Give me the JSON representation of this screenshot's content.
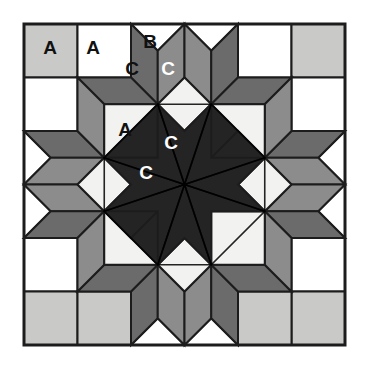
{
  "figure": {
    "name": "quilt-block-diagram",
    "width": 368,
    "height": 371,
    "background": "#ffffff"
  },
  "block": {
    "x": 24,
    "y": 24,
    "size": 321,
    "grid": 6,
    "cell": 53.5,
    "border_color": "#1c1c1c",
    "border_width": 3
  },
  "palette": {
    "white": "#ffffff",
    "offwhite": "#f2f2f0",
    "light_gray": "#c9c9c7",
    "medium_gray": "#8c8c8c",
    "dark_gray": "#6b6b6b",
    "darkest": "#242424",
    "outline": "#1c1c1c",
    "label_dark": "#111111",
    "label_light": "#ffffff"
  },
  "legend": {
    "a_meaning": "A",
    "b_meaning": "B",
    "c_meaning": "C"
  },
  "labels": [
    {
      "id": "label-a-1",
      "text": "A",
      "x": 50,
      "y": 47,
      "color": "#111111"
    },
    {
      "id": "label-a-2",
      "text": "A",
      "x": 93,
      "y": 47,
      "color": "#111111"
    },
    {
      "id": "label-b-1",
      "text": "B",
      "x": 150,
      "y": 41,
      "color": "#111111"
    },
    {
      "id": "label-c-1",
      "text": "C",
      "x": 132,
      "y": 68,
      "color": "#111111"
    },
    {
      "id": "label-c-2",
      "text": "C",
      "x": 168,
      "y": 68,
      "color": "#ffffff"
    },
    {
      "id": "label-a-3",
      "text": "A",
      "x": 125,
      "y": 129,
      "color": "#111111"
    },
    {
      "id": "label-c-3",
      "text": "C",
      "x": 171,
      "y": 142,
      "color": "#ffffff"
    },
    {
      "id": "label-c-4",
      "text": "C",
      "x": 146,
      "y": 172,
      "color": "#ffffff"
    }
  ],
  "patches": [
    {
      "name": "corner-square-top-left",
      "type": "square",
      "fill": "#c9c9c7",
      "points": "24,24 77.5,24 77.5,77.5 24,77.5"
    },
    {
      "name": "edge-square-top-1",
      "type": "square",
      "fill": "#ffffff",
      "points": "77.5,24 131,24 131,77.5 77.5,77.5"
    },
    {
      "name": "edge-square-top-2",
      "type": "square",
      "fill": "#ffffff",
      "points": "238,24 291.5,24 291.5,77.5 238,77.5"
    },
    {
      "name": "corner-square-top-right",
      "type": "square",
      "fill": "#c9c9c7",
      "points": "291.5,24 345,24 345,77.5 291.5,77.5"
    },
    {
      "name": "edge-square-left-1",
      "type": "square",
      "fill": "#ffffff",
      "points": "24,77.5 77.5,77.5 77.5,131 24,131"
    },
    {
      "name": "edge-square-right-1",
      "type": "square",
      "fill": "#ffffff",
      "points": "291.5,77.5 345,77.5 345,131 291.5,131"
    },
    {
      "name": "edge-square-left-2",
      "type": "square",
      "fill": "#ffffff",
      "points": "24,238 77.5,238 77.5,291.5 24,291.5"
    },
    {
      "name": "edge-square-right-2",
      "type": "square",
      "fill": "#ffffff",
      "points": "291.5,238 345,238 345,291.5 291.5,291.5"
    },
    {
      "name": "corner-square-bottom-left",
      "type": "square",
      "fill": "#c9c9c7",
      "points": "24,291.5 77.5,291.5 77.5,345 24,345"
    },
    {
      "name": "edge-square-bottom-1",
      "type": "square",
      "fill": "#ffffff",
      "points": "131,291.5 184.5,291.5 184.5,345 131,345"
    },
    {
      "name": "edge-square-bottom-2",
      "type": "square",
      "fill": "#ffffff",
      "points": "184.5,291.5 238,291.5 238,345 184.5,345"
    },
    {
      "name": "corner-square-bottom-right",
      "type": "square",
      "fill": "#c9c9c7",
      "points": "291.5,291.5 345,291.5 345,345 291.5,345"
    },
    {
      "name": "edge-square-bottom-left-lt",
      "type": "square",
      "fill": "#c9c9c7",
      "points": "77.5,291.5 131,291.5 131,345 77.5,345"
    },
    {
      "name": "edge-square-right-bottom-lt",
      "type": "square",
      "fill": "#c9c9c7",
      "points": "238,291.5 291.5,291.5 291.5,345 238,345"
    },
    {
      "name": "triangle-top-left-b",
      "type": "triangle",
      "fill": "#ffffff",
      "points": "131,24 184.5,24 157.75,50.75"
    },
    {
      "name": "triangle-top-right-b",
      "type": "triangle",
      "fill": "#ffffff",
      "points": "184.5,24 238,24 211.25,50.75"
    },
    {
      "name": "triangle-left-top-b",
      "type": "triangle",
      "fill": "#ffffff",
      "points": "24,131 24,184.5 50.75,157.75"
    },
    {
      "name": "triangle-left-bottom-b",
      "type": "triangle",
      "fill": "#ffffff",
      "points": "24,184.5 24,238 50.75,211.25"
    },
    {
      "name": "triangle-right-top-b",
      "type": "triangle",
      "fill": "#ffffff",
      "points": "345,131 345,184.5 318.25,157.75"
    },
    {
      "name": "triangle-right-bottom-b",
      "type": "triangle",
      "fill": "#ffffff",
      "points": "345,184.5 345,238 318.25,211.25"
    },
    {
      "name": "triangle-bottom-left-b",
      "type": "triangle",
      "fill": "#ffffff",
      "points": "131,345 184.5,345 157.75,318.25"
    },
    {
      "name": "triangle-bottom-right-b",
      "type": "triangle",
      "fill": "#ffffff",
      "points": "184.5,345 238,345 211.25,318.25"
    },
    {
      "name": "diamond-ring-tl-1",
      "type": "diamond",
      "fill": "#6b6b6b",
      "points": "131,24 157.75,50.75 157.75,104.25 131,77.5"
    },
    {
      "name": "diamond-ring-tl-2",
      "type": "diamond",
      "fill": "#8c8c8c",
      "points": "157.75,50.75 184.5,24 184.5,77.5 157.75,104.25"
    },
    {
      "name": "diamond-ring-tr-1",
      "type": "diamond",
      "fill": "#8c8c8c",
      "points": "184.5,24 211.25,50.75 211.25,104.25 184.5,77.5"
    },
    {
      "name": "diamond-ring-tr-2",
      "type": "diamond",
      "fill": "#6b6b6b",
      "points": "211.25,50.75 238,24 238,77.5 211.25,104.25"
    },
    {
      "name": "diamond-ring-lt-1",
      "type": "diamond",
      "fill": "#6b6b6b",
      "points": "24,131 50.75,157.75 104.25,157.75 77.5,131"
    },
    {
      "name": "diamond-ring-lt-2",
      "type": "diamond",
      "fill": "#8c8c8c",
      "points": "50.75,157.75 24,184.5 77.5,184.5 104.25,157.75"
    },
    {
      "name": "diamond-ring-lb-1",
      "type": "diamond",
      "fill": "#8c8c8c",
      "points": "24,184.5 50.75,211.25 104.25,211.25 77.5,184.5"
    },
    {
      "name": "diamond-ring-lb-2",
      "type": "diamond",
      "fill": "#6b6b6b",
      "points": "50.75,211.25 24,238 77.5,238 104.25,211.25"
    },
    {
      "name": "diamond-ring-rt-1",
      "type": "diamond",
      "fill": "#6b6b6b",
      "points": "345,131 318.25,157.75 264.75,157.75 291.5,131"
    },
    {
      "name": "diamond-ring-rt-2",
      "type": "diamond",
      "fill": "#8c8c8c",
      "points": "318.25,157.75 345,184.5 291.5,184.5 264.75,157.75"
    },
    {
      "name": "diamond-ring-rb-1",
      "type": "diamond",
      "fill": "#8c8c8c",
      "points": "345,184.5 318.25,211.25 264.75,211.25 291.5,184.5"
    },
    {
      "name": "diamond-ring-rb-2",
      "type": "diamond",
      "fill": "#6b6b6b",
      "points": "318.25,211.25 345,238 291.5,238 264.75,211.25"
    },
    {
      "name": "diamond-ring-bl-1",
      "type": "diamond",
      "fill": "#6b6b6b",
      "points": "131,345 157.75,318.25 157.75,264.75 131,291.5"
    },
    {
      "name": "diamond-ring-bl-2",
      "type": "diamond",
      "fill": "#8c8c8c",
      "points": "157.75,318.25 184.5,345 184.5,291.5 157.75,264.75"
    },
    {
      "name": "diamond-ring-br-1",
      "type": "diamond",
      "fill": "#8c8c8c",
      "points": "184.5,345 211.25,318.25 211.25,264.75 184.5,291.5"
    },
    {
      "name": "diamond-ring-br-2",
      "type": "diamond",
      "fill": "#6b6b6b",
      "points": "211.25,318.25 238,345 238,291.5 211.25,264.75"
    },
    {
      "name": "diamond-corner-tl-a",
      "type": "diamond",
      "fill": "#6b6b6b",
      "points": "77.5,77.5 131,77.5 157.75,104.25 104.25,104.25"
    },
    {
      "name": "diamond-corner-tl-b",
      "type": "diamond",
      "fill": "#8c8c8c",
      "points": "77.5,77.5 104.25,104.25 104.25,157.75 77.5,131"
    },
    {
      "name": "diamond-corner-tr-a",
      "type": "diamond",
      "fill": "#6b6b6b",
      "points": "291.5,77.5 238,77.5 211.25,104.25 264.75,104.25"
    },
    {
      "name": "diamond-corner-tr-b",
      "type": "diamond",
      "fill": "#8c8c8c",
      "points": "291.5,77.5 264.75,104.25 264.75,157.75 291.5,131"
    },
    {
      "name": "diamond-corner-bl-a",
      "type": "diamond",
      "fill": "#6b6b6b",
      "points": "77.5,291.5 131,291.5 157.75,264.75 104.25,264.75"
    },
    {
      "name": "diamond-corner-bl-b",
      "type": "diamond",
      "fill": "#8c8c8c",
      "points": "77.5,291.5 104.25,264.75 104.25,211.25 77.5,238"
    },
    {
      "name": "diamond-corner-br-a",
      "type": "diamond",
      "fill": "#6b6b6b",
      "points": "291.5,291.5 238,291.5 211.25,264.75 264.75,264.75"
    },
    {
      "name": "diamond-corner-br-b",
      "type": "diamond",
      "fill": "#8c8c8c",
      "points": "291.5,291.5 264.75,264.75 264.75,211.25 291.5,238"
    },
    {
      "name": "square-on-point-top",
      "type": "diamond",
      "fill": "#f2f2f0",
      "points": "184.5,77.5 211.25,104.25 184.5,131 157.75,104.25"
    },
    {
      "name": "square-on-point-left",
      "type": "diamond",
      "fill": "#f2f2f0",
      "points": "77.5,184.5 104.25,157.75 131,184.5 104.25,211.25"
    },
    {
      "name": "square-on-point-right",
      "type": "diamond",
      "fill": "#f2f2f0",
      "points": "291.5,184.5 264.75,157.75 238,184.5 264.75,211.25"
    },
    {
      "name": "square-on-point-bottom",
      "type": "diamond",
      "fill": "#f2f2f0",
      "points": "184.5,291.5 211.25,264.75 184.5,238 157.75,264.75"
    },
    {
      "name": "corner-square-inner-tl",
      "type": "square",
      "fill": "#f2f2f0",
      "points": "104.25,104.25 157.75,104.25 157.75,157.75 104.25,157.75"
    },
    {
      "name": "corner-square-inner-tr",
      "type": "square",
      "fill": "#f2f2f0",
      "points": "211.25,104.25 264.75,104.25 264.75,157.75 211.25,157.75"
    },
    {
      "name": "corner-square-inner-bl",
      "type": "square",
      "fill": "#f2f2f0",
      "points": "104.25,211.25 157.75,211.25 157.75,264.75 104.25,264.75"
    },
    {
      "name": "corner-square-inner-br",
      "type": "square",
      "fill": "#f2f2f0",
      "points": "211.25,211.25 264.75,211.25 264.75,264.75 211.25,264.75"
    },
    {
      "name": "star-point-n",
      "type": "star-point",
      "fill": "#242424",
      "points": "184.5,131 211.25,157.75 184.5,184.5 157.75,157.75"
    },
    {
      "name": "star-point-ne",
      "type": "star-point",
      "fill": "#242424",
      "points": "211.25,104.25 264.75,157.75 211.25,157.75 184.5,131"
    },
    {
      "name": "star-point-e",
      "type": "star-point",
      "fill": "#242424",
      "points": "238,184.5 211.25,157.75 238,131 264.75,157.75"
    },
    {
      "name": "star-point-se",
      "type": "star-point",
      "fill": "#242424",
      "points": "264.75,211.25 211.25,211.25 211.25,157.75 238,184.5"
    },
    {
      "name": "star-point-s",
      "type": "star-point",
      "fill": "#242424",
      "points": "184.5,238 157.75,211.25 184.5,184.5 211.25,211.25"
    },
    {
      "name": "star-point-sw",
      "type": "star-point",
      "fill": "#242424",
      "points": "157.75,264.75 104.25,211.25 157.75,211.25 184.5,238"
    },
    {
      "name": "star-point-w",
      "type": "star-point",
      "fill": "#242424",
      "points": "131,184.5 157.75,211.25 131,238 104.25,211.25"
    },
    {
      "name": "star-point-nw",
      "type": "star-point",
      "fill": "#242424",
      "points": "104.25,157.75 157.75,157.75 157.75,104.25 131,131"
    }
  ],
  "star_center": {
    "name": "eight-point-star",
    "fill": "#242424",
    "cx": 184.5,
    "cy": 184.5,
    "points": "157.75,104.25 184.5,131 211.25,104.25 211.25,157.75 264.75,157.75 238,184.5 264.75,211.25 211.25,211.25 211.25,264.75 184.5,238 157.75,264.75 157.75,211.25 104.25,211.25 131,184.5 104.25,157.75 157.75,157.75"
  },
  "star_spokes": [
    {
      "name": "spoke-1",
      "points": "184.5,184.5 157.75,104.25 211.25,104.25"
    },
    {
      "name": "spoke-2",
      "points": "184.5,184.5 211.25,104.25 264.75,157.75"
    },
    {
      "name": "spoke-3",
      "points": "184.5,184.5 264.75,157.75 264.75,211.25"
    },
    {
      "name": "spoke-4",
      "points": "184.5,184.5 264.75,211.25 211.25,264.75"
    },
    {
      "name": "spoke-5",
      "points": "184.5,184.5 211.25,264.75 157.75,264.75"
    },
    {
      "name": "spoke-6",
      "points": "184.5,184.5 157.75,264.75 104.25,211.25"
    },
    {
      "name": "spoke-7",
      "points": "184.5,184.5 104.25,211.25 104.25,157.75"
    },
    {
      "name": "spoke-8",
      "points": "184.5,184.5 104.25,157.75 157.75,104.25"
    }
  ]
}
